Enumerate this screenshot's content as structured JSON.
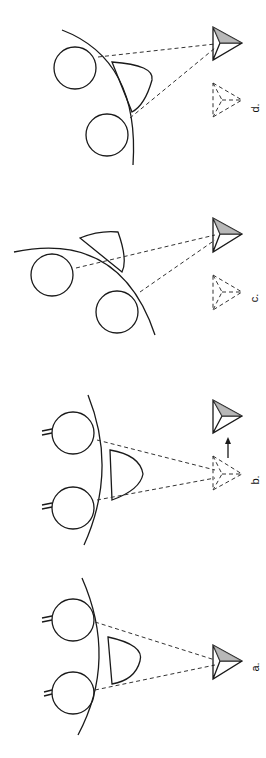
{
  "figure": {
    "orientation": "rotated-90-ccw",
    "panels": [
      {
        "id": "a",
        "label": "a.",
        "description": "Two eyes and nose viewing a pyramid directly ahead"
      },
      {
        "id": "b",
        "label": "b.",
        "description": "Dashed pyramid shown with arrow to displaced solid pyramid"
      },
      {
        "id": "c",
        "label": "c.",
        "description": "Head rotated; solid pyramid with dashed reference"
      },
      {
        "id": "d",
        "label": "d.",
        "description": "Head rotated further; solid pyramid with dashed reference"
      }
    ],
    "colors": {
      "line": "#1a1a1a",
      "shading": "#888888",
      "background": "#ffffff"
    }
  }
}
